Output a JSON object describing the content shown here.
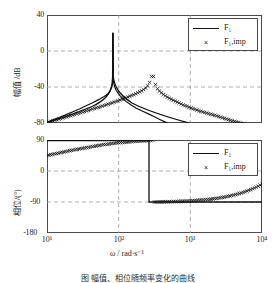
{
  "figure": {
    "caption": "图          幅值、相位随频率变化的曲线",
    "xlabel": "ω / rad·s⁻¹"
  },
  "chart_data": [
    {
      "id": "magnitude",
      "type": "line",
      "title": "",
      "xlabel": "ω / rad·s⁻¹",
      "ylabel": "幅值 /dB",
      "xscale": "log",
      "xlim": [
        10,
        10000
      ],
      "ylim": [
        -80,
        40
      ],
      "xticks": [
        10,
        100,
        1000,
        10000
      ],
      "xticklabels": [
        "10¹",
        "10²",
        "10³",
        "10⁴"
      ],
      "yticks": [
        -80,
        -40,
        0,
        40
      ],
      "yticklabels": [
        "-80",
        "-40",
        "0",
        "40"
      ],
      "grid": true,
      "grid_style": "dashed",
      "legend": {
        "position": "top-right",
        "entries": [
          {
            "label": "F₁",
            "style": "line",
            "color": "#111111"
          },
          {
            "label": "F₁,imp",
            "style": "marker-x",
            "color": "#111111"
          }
        ]
      },
      "resonance_omega": 300,
      "peak_value_db": 28,
      "series": [
        {
          "name": "F₁",
          "style": "line",
          "x": [
            10,
            14,
            20,
            28,
            40,
            56,
            79,
            112,
            158,
            200,
            224,
            251,
            266,
            282,
            291,
            296,
            299,
            300,
            301,
            304,
            309,
            316,
            335,
            355,
            398,
            447,
            501,
            631,
            794,
            1000,
            1412,
            2000,
            2818,
            3981,
            5623,
            7943,
            10000
          ],
          "y": [
            -79.6,
            -76.6,
            -73.5,
            -70.5,
            -67.3,
            -64.2,
            -61.0,
            -57.6,
            -53.8,
            -51.0,
            -49.2,
            -46.6,
            -44.6,
            -41.3,
            -37.6,
            -33.2,
            -27.0,
            28.0,
            -26.5,
            -32.0,
            -36.0,
            -39.0,
            -43.5,
            -46.0,
            -49.8,
            -52.8,
            -55.4,
            -59.7,
            -63.5,
            -66.5,
            -70.1,
            -73.1,
            -76.1,
            -79.0,
            -81.9,
            -84.8,
            -86.5
          ]
        },
        {
          "name": "F₁,imp",
          "style": "marker-x",
          "x": [
            10,
            13,
            17,
            22,
            28,
            36,
            46,
            60,
            77,
            99,
            127,
            163,
            209,
            240,
            262,
            278,
            288,
            295,
            299,
            301,
            306,
            316,
            340,
            380,
            440,
            520,
            640,
            800,
            1000,
            1300,
            1700,
            2200,
            2900,
            3800,
            5000,
            6500,
            8500,
            10000
          ],
          "y": [
            -79.4,
            -76.8,
            -74.2,
            -71.6,
            -69.0,
            -66.4,
            -63.7,
            -61.0,
            -58.2,
            -55.2,
            -52.0,
            -48.5,
            -44.3,
            -41.0,
            -37.2,
            -32.5,
            -28.0,
            -22.0,
            -16.0,
            -17.0,
            -28.0,
            -34.5,
            -41.0,
            -45.5,
            -49.5,
            -53.0,
            -56.5,
            -60.0,
            -63.0,
            -66.2,
            -69.0,
            -71.5,
            -74.5,
            -77.5,
            -80.0,
            -82.5,
            -85.0,
            -86.3
          ]
        }
      ]
    },
    {
      "id": "phase",
      "type": "line",
      "title": "",
      "xlabel": "ω / rad·s⁻¹",
      "ylabel": "相位/(°)",
      "xscale": "log",
      "xlim": [
        10,
        10000
      ],
      "ylim": [
        -180,
        90
      ],
      "xticks": [
        10,
        100,
        1000,
        10000
      ],
      "xticklabels": [
        "10¹",
        "10²",
        "10³",
        "10⁴"
      ],
      "yticks": [
        -180,
        -90,
        0,
        90
      ],
      "yticklabels": [
        "-180",
        "-90",
        "0",
        "90"
      ],
      "grid": true,
      "grid_style": "dashed",
      "legend": {
        "position": "top-right",
        "entries": [
          {
            "label": "F₁",
            "style": "line",
            "color": "#111111"
          },
          {
            "label": "F₁,imp",
            "style": "marker-x",
            "color": "#111111"
          }
        ]
      },
      "phase_jump_omega": 300,
      "series": [
        {
          "name": "F₁",
          "style": "line",
          "x": [
            10,
            100,
            299,
            300,
            301,
            1000,
            10000
          ],
          "y": [
            90,
            90,
            90,
            -90,
            -90,
            -90,
            -90
          ]
        },
        {
          "name": "F₁,imp",
          "style": "marker-x",
          "x": [
            10,
            13,
            17,
            22,
            28,
            36,
            46,
            60,
            77,
            99,
            127,
            163,
            209,
            250,
            280,
            299,
            302,
            330,
            380,
            450,
            560,
            700,
            900,
            1150,
            1500,
            1950,
            2500,
            3200,
            4100,
            5300,
            6800,
            8700,
            10000
          ],
          "y": [
            45,
            50,
            55,
            60,
            64,
            68,
            72,
            76,
            79,
            82,
            84,
            86,
            87.5,
            88.5,
            89,
            89.5,
            -90,
            -90,
            -89.8,
            -89.5,
            -89,
            -88.2,
            -87.2,
            -85.8,
            -84,
            -81.5,
            -78.5,
            -74.5,
            -69.5,
            -63,
            -55,
            -45,
            -38
          ]
        }
      ]
    }
  ]
}
